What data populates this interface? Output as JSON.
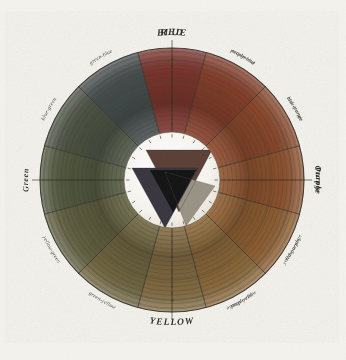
{
  "plate": {
    "title": "Colour wheel plate",
    "background_color": "#f4f2ec",
    "ink_color": "#3a342c",
    "paper_tone": "#efece3"
  },
  "wheel": {
    "center_x": 172,
    "center_y": 180,
    "outer_radius": 132,
    "inner_disc_radius": 48,
    "sector_count": 12,
    "ring_count": 20,
    "inner_disc_color": "#f6f4ee"
  },
  "hues": [
    {
      "name": "RED",
      "rank": "primary",
      "angle": 0,
      "color": "#8c3a32"
    },
    {
      "name": "orange-red",
      "rank": "tertiary",
      "angle": 30,
      "color": "#96452f"
    },
    {
      "name": "red-orange",
      "rank": "tertiary",
      "angle": 60,
      "color": "#9c5030"
    },
    {
      "name": "Orange",
      "rank": "secondary",
      "angle": 90,
      "color": "#a05c33"
    },
    {
      "name": "yellow-orange",
      "rank": "tertiary",
      "angle": 120,
      "color": "#a06a38"
    },
    {
      "name": "orange-yellow",
      "rank": "tertiary",
      "angle": 150,
      "color": "#9c7541"
    },
    {
      "name": "YELLOW",
      "rank": "primary",
      "angle": 180,
      "color": "#93794a"
    },
    {
      "name": "green-yellow",
      "rank": "tertiary",
      "angle": 210,
      "color": "#7d7248"
    },
    {
      "name": "yellow-green",
      "rank": "tertiary",
      "angle": 240,
      "color": "#6c6c49"
    },
    {
      "name": "Green",
      "rank": "secondary",
      "angle": 270,
      "color": "#5d6549"
    },
    {
      "name": "blue-green",
      "rank": "tertiary",
      "angle": 300,
      "color": "#555e4e"
    },
    {
      "name": "green-blue",
      "rank": "tertiary",
      "angle": 330,
      "color": "#4e5758"
    },
    {
      "name": "BLUE",
      "rank": "primary",
      "angle": 360,
      "color": "#4b5160"
    },
    {
      "name": "purple-blue",
      "rank": "tertiary",
      "angle": 390,
      "color": "#524e63"
    },
    {
      "name": "blue-purple",
      "rank": "tertiary",
      "angle": 420,
      "color": "#5b4c62"
    },
    {
      "name": "Purple",
      "rank": "secondary",
      "angle": 450,
      "color": "#644a5d"
    },
    {
      "name": "red-purple",
      "rank": "tertiary",
      "angle": 480,
      "color": "#714556"
    },
    {
      "name": "purple-red",
      "rank": "tertiary",
      "angle": 510,
      "color": "#7e4049"
    }
  ],
  "labels": {
    "red": "RED",
    "orange_red": "orange-red",
    "red_orange": "red-orange",
    "orange": "Orange",
    "yellow_orange": "yellow-orange",
    "orange_yellow": "orange-yellow",
    "yellow": "YELLOW",
    "green_yellow": "green-yellow",
    "yellow_green": "yellow-green",
    "green": "Green",
    "blue_green": "blue-green",
    "green_blue": "green-blue",
    "blue": "BLUE",
    "purple_blue": "purple-blue",
    "blue_purple": "blue-purple",
    "purple": "Purple",
    "red_purple": "red-purple",
    "purple_red": "purple-red"
  },
  "triangles": [
    {
      "id": "red-triangle",
      "label": "Red primary triangle",
      "color": "#5a4038",
      "orientation": "down",
      "position": "top"
    },
    {
      "id": "blue-triangle",
      "label": "Blue primary triangle",
      "color": "#3b3a44",
      "orientation": "down",
      "position": "bottom-left"
    },
    {
      "id": "yellow-triangle",
      "label": "Yellow primary triangle",
      "color": "#9a9486",
      "orientation": "down",
      "position": "bottom-right"
    },
    {
      "id": "overlap-center",
      "label": "Central overlap (black)",
      "color": "#141414",
      "orientation": "down",
      "position": "center"
    }
  ],
  "ring_scale": {
    "visible_numerals": [
      "1",
      "2",
      "3",
      "4",
      "5",
      "6",
      "7",
      "8",
      "9",
      "10"
    ],
    "description": "Numbered tonal gradation rings along the vertical axis"
  }
}
